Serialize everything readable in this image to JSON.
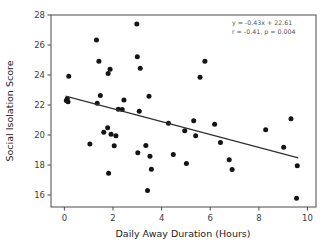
{
  "chart_data": {
    "type": "scatter",
    "title": "",
    "xlabel": "Daily Away Duration (Hours)",
    "ylabel": "Social Isolation Score",
    "xlim": [
      -0.55,
      10.35
    ],
    "ylim": [
      15.2,
      28.0
    ],
    "xticks": [
      0,
      2,
      4,
      6,
      8,
      10
    ],
    "xticklabels": [
      "0",
      "2",
      "4",
      "6",
      "8",
      "10"
    ],
    "yticks": [
      16,
      18,
      20,
      22,
      24,
      26,
      28
    ],
    "yticklabels": [
      "16",
      "18",
      "20",
      "22",
      "24",
      "26",
      "28"
    ],
    "grid": false,
    "legend": null,
    "marker_color": "#141414",
    "line_color": "#2f2f2f",
    "axis_color": "#4a4a4a",
    "annotation_color": "#55585c",
    "points": [
      {
        "x": 0.08,
        "y": 22.3
      },
      {
        "x": 0.12,
        "y": 22.42
      },
      {
        "x": 0.15,
        "y": 22.22
      },
      {
        "x": 0.18,
        "y": 23.92
      },
      {
        "x": 1.05,
        "y": 19.4
      },
      {
        "x": 1.32,
        "y": 26.33
      },
      {
        "x": 1.35,
        "y": 22.12
      },
      {
        "x": 1.42,
        "y": 24.92
      },
      {
        "x": 1.48,
        "y": 22.63
      },
      {
        "x": 1.62,
        "y": 20.18
      },
      {
        "x": 1.78,
        "y": 20.48
      },
      {
        "x": 1.8,
        "y": 24.1
      },
      {
        "x": 1.82,
        "y": 17.45
      },
      {
        "x": 1.88,
        "y": 24.38
      },
      {
        "x": 1.92,
        "y": 20.05
      },
      {
        "x": 2.05,
        "y": 19.28
      },
      {
        "x": 2.12,
        "y": 19.95
      },
      {
        "x": 2.22,
        "y": 21.72
      },
      {
        "x": 2.38,
        "y": 21.7
      },
      {
        "x": 2.45,
        "y": 22.33
      },
      {
        "x": 2.98,
        "y": 27.4
      },
      {
        "x": 3.0,
        "y": 25.22
      },
      {
        "x": 3.02,
        "y": 18.82
      },
      {
        "x": 3.08,
        "y": 21.58
      },
      {
        "x": 3.12,
        "y": 24.45
      },
      {
        "x": 3.35,
        "y": 19.3
      },
      {
        "x": 3.42,
        "y": 16.3
      },
      {
        "x": 3.48,
        "y": 22.58
      },
      {
        "x": 3.52,
        "y": 18.58
      },
      {
        "x": 3.58,
        "y": 17.72
      },
      {
        "x": 4.28,
        "y": 20.78
      },
      {
        "x": 4.48,
        "y": 18.7
      },
      {
        "x": 4.95,
        "y": 20.28
      },
      {
        "x": 5.02,
        "y": 18.1
      },
      {
        "x": 5.32,
        "y": 20.95
      },
      {
        "x": 5.4,
        "y": 19.95
      },
      {
        "x": 5.58,
        "y": 23.85
      },
      {
        "x": 5.78,
        "y": 24.92
      },
      {
        "x": 6.18,
        "y": 20.72
      },
      {
        "x": 6.42,
        "y": 19.5
      },
      {
        "x": 6.78,
        "y": 18.35
      },
      {
        "x": 6.9,
        "y": 17.7
      },
      {
        "x": 8.28,
        "y": 20.35
      },
      {
        "x": 9.02,
        "y": 19.18
      },
      {
        "x": 9.32,
        "y": 21.08
      },
      {
        "x": 9.58,
        "y": 17.95
      },
      {
        "x": 9.55,
        "y": 15.78
      }
    ],
    "fit_line": {
      "slope": -0.43,
      "intercept": 22.61,
      "x_start": 0.05,
      "x_end": 9.62
    },
    "annotations": [
      "y = -0.43x + 22.61",
      "r = -0.41, p = 0.004"
    ]
  }
}
